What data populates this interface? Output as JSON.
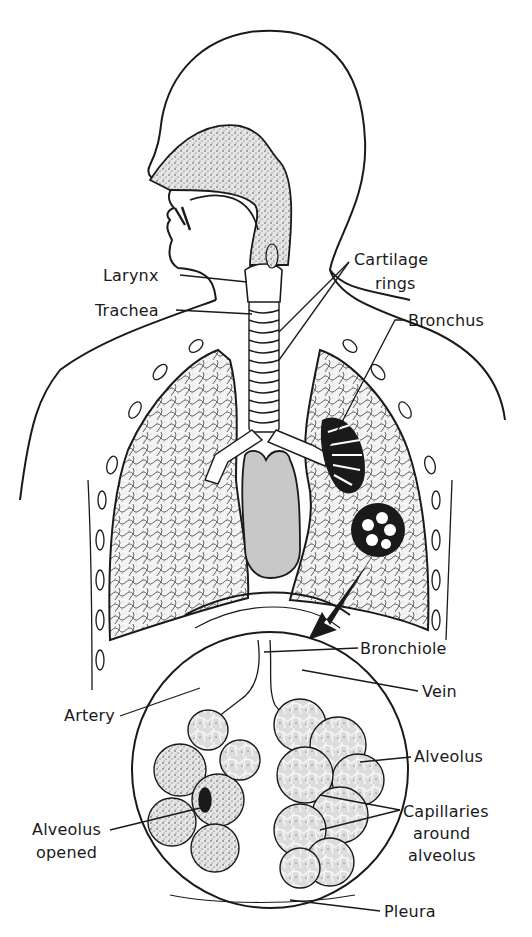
{
  "diagram": {
    "colors": {
      "ink": "#1a1a1a",
      "heart_fill": "#c8c8c8",
      "background": "#ffffff"
    },
    "labels": {
      "larynx": "Larynx",
      "trachea": "Trachea",
      "cartilage_rings_1": "Cartilage",
      "cartilage_rings_2": "rings",
      "bronchus": "Bronchus",
      "bronchiole": "Bronchiole",
      "vein": "Vein",
      "artery": "Artery",
      "alveolus": "Alveolus",
      "alveolus_opened_1": "Alveolus",
      "alveolus_opened_2": "opened",
      "capillaries_1": "Capillaries",
      "capillaries_2": "around",
      "capillaries_3": "alveolus",
      "pleura": "Pleura"
    }
  }
}
